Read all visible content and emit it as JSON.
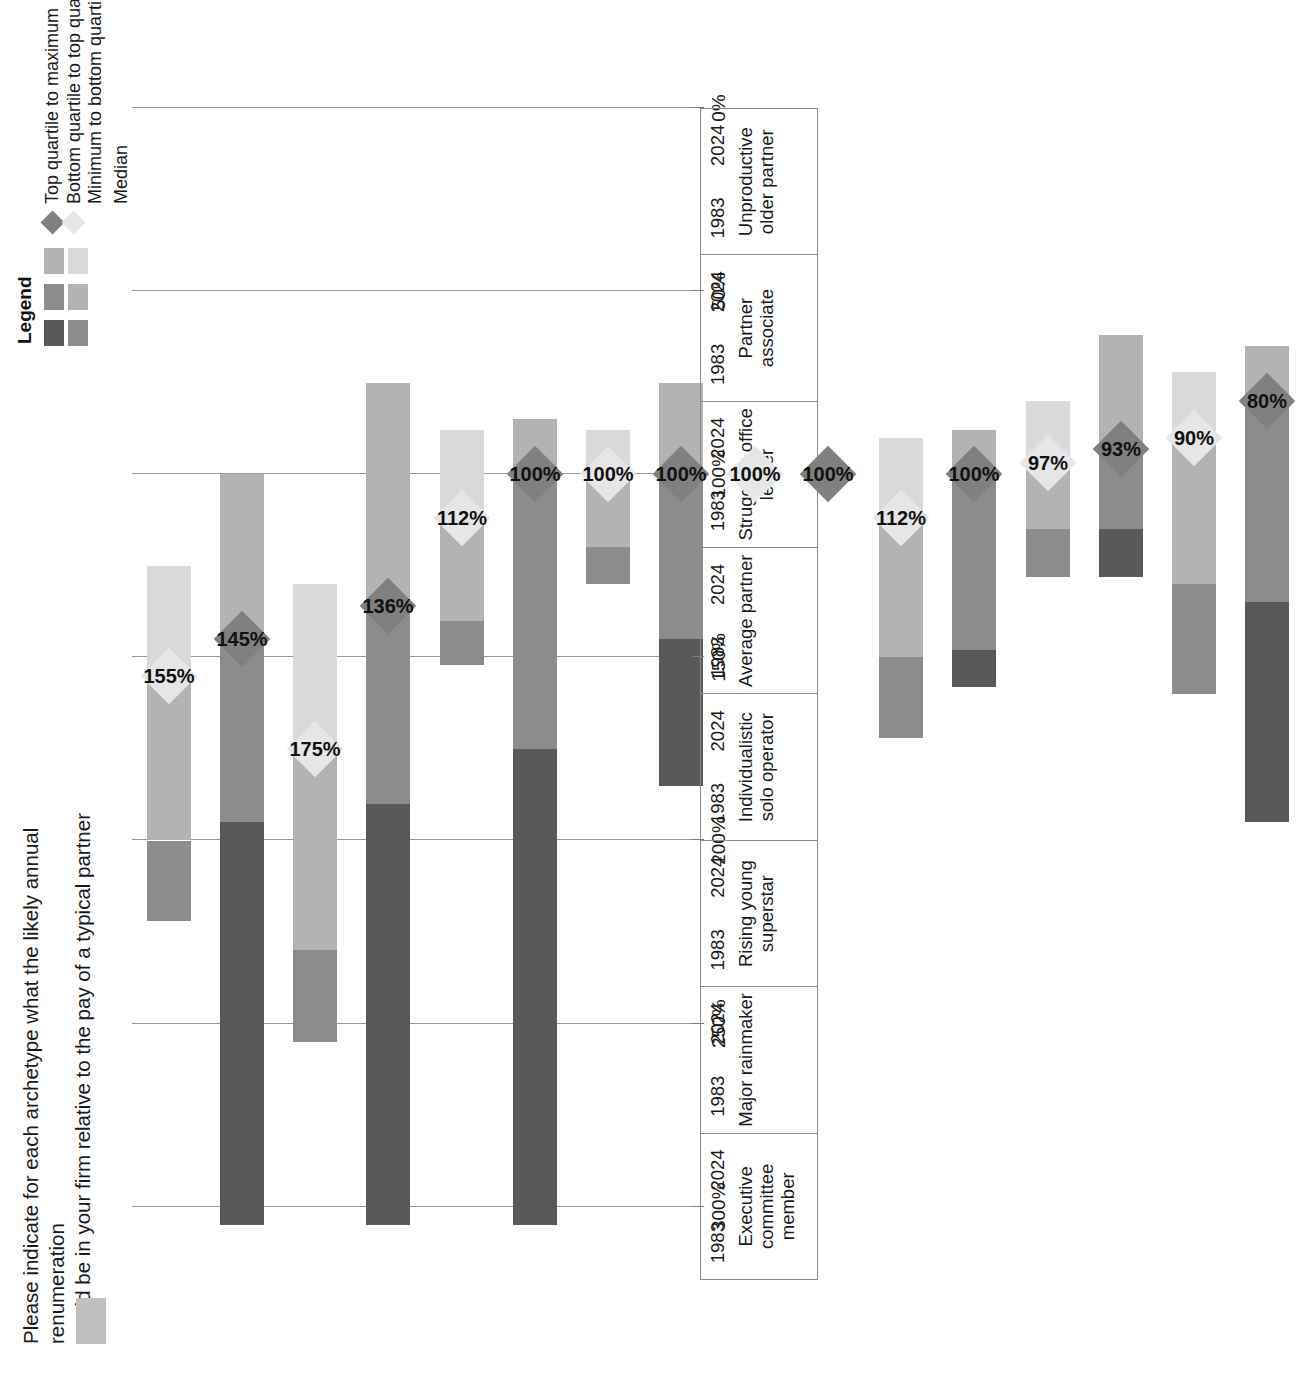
{
  "title": {
    "line1": "Please indicate for each archetype what the likely annual renumeration",
    "line2": "would be in your firm relative to the pay of a typical partner"
  },
  "legend": {
    "heading": "Legend",
    "items": [
      "Top quartile to maximum",
      "Bottom quartile to top quartile",
      "Minimum to bottom quartile",
      "Median"
    ],
    "colors_2024": {
      "top_to_max": "#595959",
      "bottom_to_top": "#8c8c8c",
      "min_to_bottom": "#b3b3b3",
      "median": "#808080"
    },
    "colors_1983": {
      "top_to_max": "#8c8c8c",
      "bottom_to_top": "#b3b3b3",
      "min_to_bottom": "#d9d9d9",
      "median": "#e6e6e6"
    }
  },
  "axis": {
    "ticks": [
      "300%",
      "250%",
      "200%",
      "150%",
      "100%",
      "50%",
      "0%"
    ],
    "values": [
      300,
      250,
      200,
      150,
      100,
      50,
      0
    ],
    "max": 320,
    "min": 0
  },
  "years": [
    "1983",
    "2024"
  ],
  "chart_data": {
    "type": "bar",
    "title": "Please indicate for each archetype what the likely annual renumeration would be in your firm relative to the pay of a typical partner",
    "xlabel": "",
    "ylabel": "Remuneration relative to typical partner pay",
    "ylim": [
      0,
      320
    ],
    "grid": true,
    "legend_position": "top-right",
    "orientation": "horizontal-floating-bar",
    "categories": [
      "Executive committee member",
      "Major rainmaker",
      "Rising young superstar",
      "Individualistic solo operator",
      "Average partner",
      "Struggling office leader",
      "Partner associate",
      "Unproductive older partner"
    ],
    "series": [
      {
        "name": "1983",
        "bars": [
          {
            "category": "Executive committee member",
            "minimum": 125,
            "bottom_quartile": 155,
            "top_quartile": 200,
            "maximum": 222,
            "median": 155,
            "label": "155%"
          },
          {
            "category": "Major rainmaker",
            "minimum": 130,
            "bottom_quartile": 175,
            "top_quartile": 230,
            "maximum": 255,
            "median": 175,
            "label": "175%"
          },
          {
            "category": "Rising young superstar",
            "minimum": 88,
            "bottom_quartile": 112,
            "top_quartile": 140,
            "maximum": 152,
            "median": 112,
            "label": "112%"
          },
          {
            "category": "Individualistic solo operator",
            "minimum": 88,
            "bottom_quartile": 100,
            "top_quartile": 120,
            "maximum": 130,
            "median": 100,
            "label": "100%"
          },
          {
            "category": "Average partner",
            "minimum": 100,
            "bottom_quartile": 100,
            "top_quartile": 100,
            "maximum": 100,
            "median": 100,
            "label": "100%"
          },
          {
            "category": "Struggling office leader",
            "minimum": 90,
            "bottom_quartile": 112,
            "top_quartile": 150,
            "maximum": 172,
            "median": 112,
            "label": "112%"
          },
          {
            "category": "Partner associate",
            "minimum": 80,
            "bottom_quartile": 97,
            "top_quartile": 115,
            "maximum": 128,
            "median": 97,
            "label": "97%"
          },
          {
            "category": "Unproductive older partner",
            "minimum": 72,
            "bottom_quartile": 90,
            "top_quartile": 130,
            "maximum": 160,
            "median": 90,
            "label": "90%"
          }
        ]
      },
      {
        "name": "2024",
        "bars": [
          {
            "category": "Executive committee member",
            "minimum": 100,
            "bottom_quartile": 145,
            "top_quartile": 195,
            "maximum": 305,
            "median": 145,
            "label": "145%"
          },
          {
            "category": "Major rainmaker",
            "minimum": 75,
            "bottom_quartile": 136,
            "top_quartile": 190,
            "maximum": 305,
            "median": 136,
            "label": "136%"
          },
          {
            "category": "Rising young superstar",
            "minimum": 85,
            "bottom_quartile": 100,
            "top_quartile": 175,
            "maximum": 305,
            "median": 100,
            "label": "100%"
          },
          {
            "category": "Individualistic solo operator",
            "minimum": 75,
            "bottom_quartile": 100,
            "top_quartile": 145,
            "maximum": 185,
            "median": 100,
            "label": "100%"
          },
          {
            "category": "Average partner",
            "minimum": 100,
            "bottom_quartile": 100,
            "top_quartile": 100,
            "maximum": 100,
            "median": 100,
            "label": "100%"
          },
          {
            "category": "Struggling office leader",
            "minimum": 88,
            "bottom_quartile": 100,
            "top_quartile": 148,
            "maximum": 158,
            "median": 100,
            "label": "100%"
          },
          {
            "category": "Partner associate",
            "minimum": 62,
            "bottom_quartile": 93,
            "top_quartile": 115,
            "maximum": 128,
            "median": 93,
            "label": "93%"
          },
          {
            "category": "Unproductive older partner",
            "minimum": 65,
            "bottom_quartile": 80,
            "top_quartile": 135,
            "maximum": 195,
            "median": 80,
            "label": "80%"
          }
        ]
      }
    ]
  }
}
